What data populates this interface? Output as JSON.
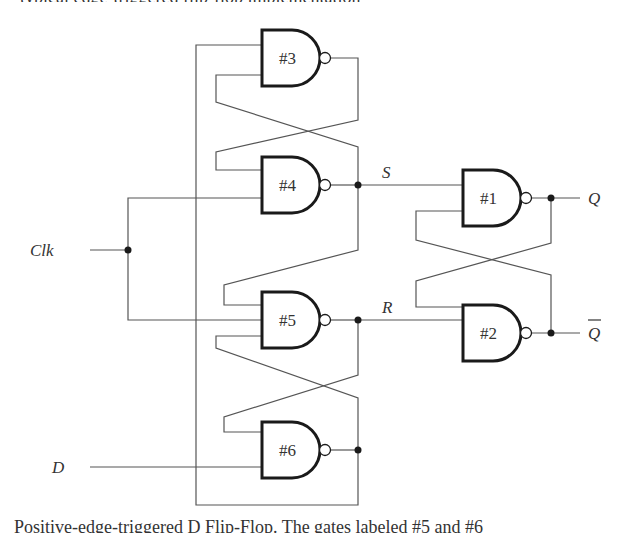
{
  "figure": {
    "top_caption_fragment": "typical edge-triggered flip-flop implementation",
    "bottom_caption_fragment": "Positive-edge-triggered D Flip-Flop. The gates labeled #5 and #6"
  },
  "gates": [
    {
      "id": "#1",
      "type": "NAND",
      "inputs": 2
    },
    {
      "id": "#2",
      "type": "NAND",
      "inputs": 2
    },
    {
      "id": "#3",
      "type": "NAND",
      "inputs": 2
    },
    {
      "id": "#4",
      "type": "NAND",
      "inputs": 2
    },
    {
      "id": "#5",
      "type": "NAND",
      "inputs": 3
    },
    {
      "id": "#6",
      "type": "NAND",
      "inputs": 2
    }
  ],
  "signals": {
    "clk": "Clk",
    "d": "D",
    "s": "S",
    "r": "R",
    "q": "Q",
    "q_bar": "Q"
  },
  "colors": {
    "wire": "#555555",
    "gate_outline": "#1a1a1a",
    "background": "#ffffff"
  }
}
